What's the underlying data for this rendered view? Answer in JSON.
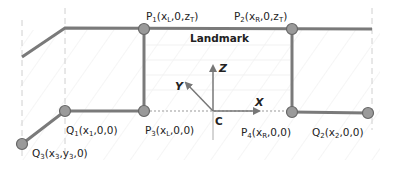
{
  "diagram": {
    "title_label": "Landmark",
    "colors": {
      "line": "#7a7a7a",
      "node_fill": "#9a9a9a",
      "node_stroke": "#666666",
      "axis": "#777777",
      "dashed_guide": "#d0d0d0",
      "hatch": "#eeeeee",
      "text": "#222222"
    },
    "axes": {
      "origin_label": "C",
      "x_label": "X",
      "y_label": "Y",
      "z_label": "Z"
    },
    "points": [
      {
        "id": "P1",
        "base": "P",
        "sub": "1",
        "coords_pre": "(x",
        "coords_sub1": "L",
        "coords_mid": ",0,z",
        "coords_sub2": "T",
        "coords_post": ")",
        "x": 144,
        "y": 29
      },
      {
        "id": "P2",
        "base": "P",
        "sub": "2",
        "coords_pre": "(x",
        "coords_sub1": "R",
        "coords_mid": ",0,z",
        "coords_sub2": "T",
        "coords_post": ")",
        "x": 292,
        "y": 29
      },
      {
        "id": "P3",
        "base": "P",
        "sub": "3",
        "coords_pre": "(x",
        "coords_sub1": "L",
        "coords_mid": ",0,0)",
        "x": 144,
        "y": 111
      },
      {
        "id": "P4",
        "base": "P",
        "sub": "4",
        "coords_pre": "(x",
        "coords_sub1": "R",
        "coords_mid": ",0,0)",
        "x": 292,
        "y": 112
      },
      {
        "id": "Q1",
        "base": "Q",
        "sub": "1",
        "coords_pre": "(x",
        "coords_sub1": "1",
        "coords_mid": ",0,0)",
        "x": 65,
        "y": 111
      },
      {
        "id": "Q2",
        "base": "Q",
        "sub": "2",
        "coords_pre": "(x",
        "coords_sub1": "2",
        "coords_mid": ",0,0)",
        "x": 368,
        "y": 113
      },
      {
        "id": "Q3",
        "base": "Q",
        "sub": "3",
        "coords_pre": "(x",
        "coords_sub1": "3",
        "coords_mid": ",y",
        "coords_sub2": "3",
        "coords_post": ",0)",
        "x": 22,
        "y": 144
      }
    ]
  }
}
